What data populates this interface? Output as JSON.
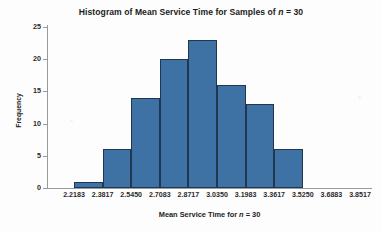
{
  "chart_data": {
    "type": "bar",
    "title": "Histogram of Mean Service Time for Samples of n = 30",
    "title_parts": {
      "before": "Histogram of Mean Service Time for Samples of ",
      "italic": "n",
      "after": " = 30"
    },
    "xlabel": "Mean Service Time for n = 30",
    "xlabel_parts": {
      "before": "Mean Service Time for ",
      "italic": "n",
      "after": " = 30"
    },
    "ylabel": "Frequency",
    "ylim": [
      0,
      25
    ],
    "yticks": [
      0,
      5,
      10,
      15,
      20,
      25
    ],
    "ytick_labels": [
      "0",
      "5",
      "10",
      "15",
      "20",
      "25"
    ],
    "xtick_labels": [
      "2.2183",
      "2.3817",
      "2.5450",
      "2.7083",
      "2.8717",
      "3.0350",
      "3.1983",
      "3.3617",
      "3.5250",
      "3.6883",
      "3.8517"
    ],
    "xtick_values": [
      2.2183,
      2.3817,
      2.545,
      2.7083,
      2.8717,
      3.035,
      3.1983,
      3.3617,
      3.525,
      3.6883,
      3.8517
    ],
    "bin_width": 0.1633,
    "bins": [
      {
        "left": 2.2183,
        "right": 2.3817,
        "frequency": 1
      },
      {
        "left": 2.3817,
        "right": 2.545,
        "frequency": 6
      },
      {
        "left": 2.545,
        "right": 2.7083,
        "frequency": 14
      },
      {
        "left": 2.7083,
        "right": 2.8717,
        "frequency": 20
      },
      {
        "left": 2.8717,
        "right": 3.035,
        "frequency": 23
      },
      {
        "left": 3.035,
        "right": 3.1983,
        "frequency": 16
      },
      {
        "left": 3.1983,
        "right": 3.3617,
        "frequency": 13
      },
      {
        "left": 3.3617,
        "right": 3.525,
        "frequency": 6
      }
    ],
    "categories": [
      "2.2183-2.3817",
      "2.3817-2.5450",
      "2.5450-2.7083",
      "2.7083-2.8717",
      "2.8717-3.0350",
      "3.0350-3.1983",
      "3.1983-3.3617",
      "3.3617-3.5250"
    ],
    "values": [
      1,
      6,
      14,
      20,
      23,
      16,
      13,
      6
    ],
    "grid": false,
    "legend": false,
    "colors": {
      "bar_fill": "#3e72a5",
      "bar_border": "#21364f",
      "axis": "#9a9a9a",
      "text": "#1c1c1c",
      "background": "#fdfdfd"
    }
  }
}
